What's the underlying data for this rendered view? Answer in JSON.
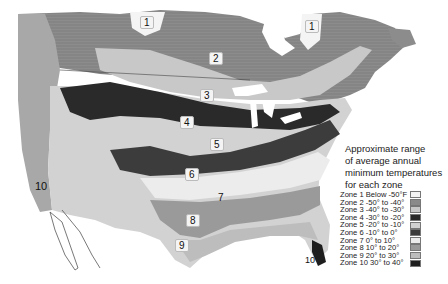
{
  "map": {
    "title": "Approximate range of average annual minimum temperatures for each zone",
    "title_lines": [
      "Approximate range",
      "of average annual",
      "minimum temperatures",
      "for each zone"
    ],
    "region": "North America (Canada, United States, northern Mexico)",
    "style": "grayscale"
  },
  "zone_labels": [
    {
      "id": "1a",
      "text": "1"
    },
    {
      "id": "1b",
      "text": "1"
    },
    {
      "id": "2",
      "text": "2"
    },
    {
      "id": "3",
      "text": "3"
    },
    {
      "id": "4",
      "text": "4"
    },
    {
      "id": "5",
      "text": "5"
    },
    {
      "id": "6",
      "text": "6"
    },
    {
      "id": "7",
      "text": "7"
    },
    {
      "id": "8",
      "text": "8"
    },
    {
      "id": "9",
      "text": "9"
    },
    {
      "id": "10a",
      "text": "10"
    },
    {
      "id": "10b",
      "text": "10"
    }
  ],
  "legend": [
    {
      "zone": "Zone 1",
      "range": "Below -50°F",
      "color": "#f4f4f4"
    },
    {
      "zone": "Zone 2",
      "range": "-50° to -40°",
      "color": "#8a8a8a"
    },
    {
      "zone": "Zone 3",
      "range": "-40° to -30°",
      "color": "#c8c8c8"
    },
    {
      "zone": "Zone 4",
      "range": "-30° to -20°",
      "color": "#2a2a2a"
    },
    {
      "zone": "Zone 5",
      "range": "-20° to -10°",
      "color": "#d2d2d2"
    },
    {
      "zone": "Zone 6",
      "range": "-10° to 0°",
      "color": "#3c3c3c"
    },
    {
      "zone": "Zone 7",
      "range": "0° to 10°",
      "color": "#ececec"
    },
    {
      "zone": "Zone 8",
      "range": "10° to 20°",
      "color": "#9a9a9a"
    },
    {
      "zone": "Zone 9",
      "range": "20° to 30°",
      "color": "#bdbdbd"
    },
    {
      "zone": "Zone 10",
      "range": "30° to 40°",
      "color": "#1e1e1e"
    }
  ]
}
